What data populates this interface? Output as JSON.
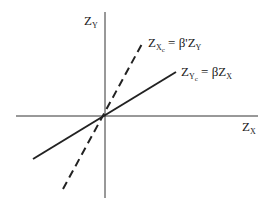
{
  "diagram": {
    "axes": {
      "y_axis_label": {
        "main": "Z",
        "sub": "Y"
      },
      "x_axis_label": {
        "main": "Z",
        "sub": "X"
      }
    },
    "lines": [
      {
        "name": "Z_Xc = β'Z_Y",
        "style": "dashed",
        "label": {
          "lhs_main": "Z",
          "lhs_sub": "X",
          "lhs_subsub": "c",
          "eq": " = ",
          "rhs_main": "β'Z",
          "rhs_sub": "Y"
        }
      },
      {
        "name": "Z_Yc = βZ_X",
        "style": "solid",
        "label": {
          "lhs_main": "Z",
          "lhs_sub": "Y",
          "lhs_subsub": "c",
          "eq": " = ",
          "rhs_main": "βZ",
          "rhs_sub": "X"
        }
      }
    ],
    "colors": {
      "ink": "#222222",
      "background": "#ffffff"
    }
  }
}
